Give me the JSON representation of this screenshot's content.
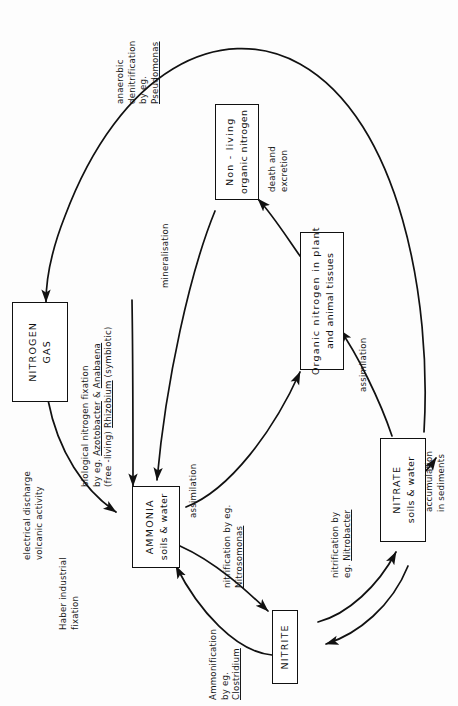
{
  "diagram": {
    "orientation": "rotated-90-ccw",
    "nodes": [
      {
        "id": "nitrogen_gas",
        "line1": "NITROGEN",
        "line2": "GAS"
      },
      {
        "id": "non_living",
        "line1": "Non - living",
        "line2": "organic nitrogen"
      },
      {
        "id": "organic_n",
        "line1": "Organic nitrogen in plant",
        "line2": "and animal tissues"
      },
      {
        "id": "ammonia",
        "line1": "AMMONIA",
        "line2": "soils & water"
      },
      {
        "id": "nitrite",
        "line1": "NITRITE",
        "line2": ""
      },
      {
        "id": "nitrate",
        "line1": "NITRATE",
        "line2": "soils & water"
      }
    ],
    "edge_labels": [
      {
        "id": "denitrification",
        "lines": [
          "anaerobic",
          "denitrification",
          "by eg.",
          "Pseudomonas"
        ],
        "underlined": [
          "Pseudomonas"
        ]
      },
      {
        "id": "bio_fixation",
        "lines": [
          "biological nitrogen fixation",
          "by eg. Azotobacter & Anabaena",
          "(free -living)  Rhizobium (symbiotic)"
        ],
        "underlined": [
          "Azotobacter",
          "Anabaena",
          "Rhizobium"
        ]
      },
      {
        "id": "electrical",
        "lines": [
          "electrical discharge",
          "volcanic activity"
        ],
        "underlined": []
      },
      {
        "id": "haber",
        "lines": [
          "Haber industrial",
          "fixation"
        ],
        "underlined": []
      },
      {
        "id": "mineralisation",
        "lines": [
          "mineralisation"
        ],
        "underlined": []
      },
      {
        "id": "death",
        "lines": [
          "death and",
          "excretion"
        ],
        "underlined": []
      },
      {
        "id": "assim_ammonia",
        "lines": [
          "assimilation"
        ],
        "underlined": []
      },
      {
        "id": "assim_nitrate",
        "lines": [
          "assimilation"
        ],
        "underlined": []
      },
      {
        "id": "nitrosomonas",
        "lines": [
          "nitrification by eg.",
          "Nitrosomonas"
        ],
        "underlined": [
          "Nitrosomonas"
        ]
      },
      {
        "id": "nitrobacter",
        "lines": [
          "nitrification by",
          "eg. Nitrobacter"
        ],
        "underlined": [
          "Nitrobacter"
        ]
      },
      {
        "id": "ammonification",
        "lines": [
          "Ammonification",
          "by eg.",
          "Clostridium"
        ],
        "underlined": [
          "Clostridium"
        ]
      },
      {
        "id": "accumulation",
        "lines": [
          "accumulation",
          "in sediments"
        ],
        "underlined": []
      }
    ],
    "colors": {
      "ink": "#111111",
      "background": "#ffffff"
    }
  },
  "labels": {
    "nitrogen_gas_1": "NITROGEN",
    "nitrogen_gas_2": "GAS",
    "non_living_1": "Non - living",
    "non_living_2": "organic nitrogen",
    "organic_n_1": "Organic nitrogen in plant",
    "organic_n_2": "and animal tissues",
    "ammonia_1": "AMMONIA",
    "ammonia_2": "soils & water",
    "nitrite_1": "NITRITE",
    "nitrate_1": "NITRATE",
    "nitrate_2": "soils & water",
    "denit_1": "anaerobic",
    "denit_2": "denitrification",
    "denit_3": "by eg.",
    "denit_4": "Pseudomonas",
    "biofix_1": "biological nitrogen fixation",
    "biofix_2a": "by eg. ",
    "biofix_2b": "Azotobacter",
    "biofix_2c": " & ",
    "biofix_2d": "Anabaena",
    "biofix_3a": "(free -living) ",
    "biofix_3b": "Rhizobium",
    "biofix_3c": " (symbiotic)",
    "elec_1": "electrical discharge",
    "elec_2": "volcanic activity",
    "haber_1": "Haber industrial",
    "haber_2": "fixation",
    "mineralisation": "mineralisation",
    "death_1": "death and",
    "death_2": "excretion",
    "assim_ammonia": "assimilation",
    "assim_nitrate": "assimilation",
    "nitroso_1": "nitrification by eg.",
    "nitroso_2": "Nitrosomonas",
    "nitrobact_1": "nitrification by",
    "nitrobact_2a": "eg. ",
    "nitrobact_2b": "Nitrobacter",
    "ammonif_1": "Ammonification",
    "ammonif_2": "by eg.",
    "ammonif_3": "Clostridium",
    "accum_1": "accumulation",
    "accum_2": "in sediments"
  }
}
